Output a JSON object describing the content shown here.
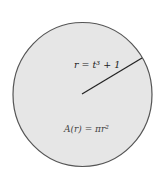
{
  "diagram": {
    "shape": "circle",
    "fill_color": "#e6e6e6",
    "stroke_color": "#555555",
    "radius_label": "r = t³ + 1",
    "area_label": "A(r) = πr²"
  }
}
